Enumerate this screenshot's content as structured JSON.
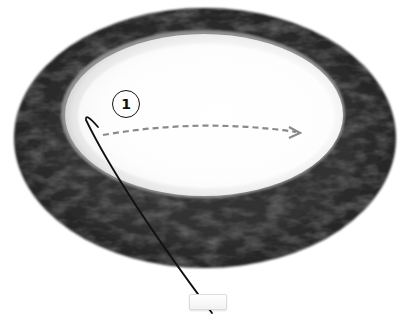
{
  "diagram": {
    "type": "anatomical-illustration",
    "step_label": "1",
    "colors": {
      "ring": "#2e2e2e",
      "ring_highlight": "#6a6a6a",
      "inner_field": "#ffffff",
      "inner_shadow": "#bdbdbd",
      "arrow": "#8a8a8a",
      "instrument": "#111111",
      "background": "#ffffff"
    },
    "arrow": {
      "style": "dashed",
      "direction": "left-to-right"
    },
    "instrument": {
      "shape": "hook",
      "direction": "enters from bottom"
    }
  }
}
